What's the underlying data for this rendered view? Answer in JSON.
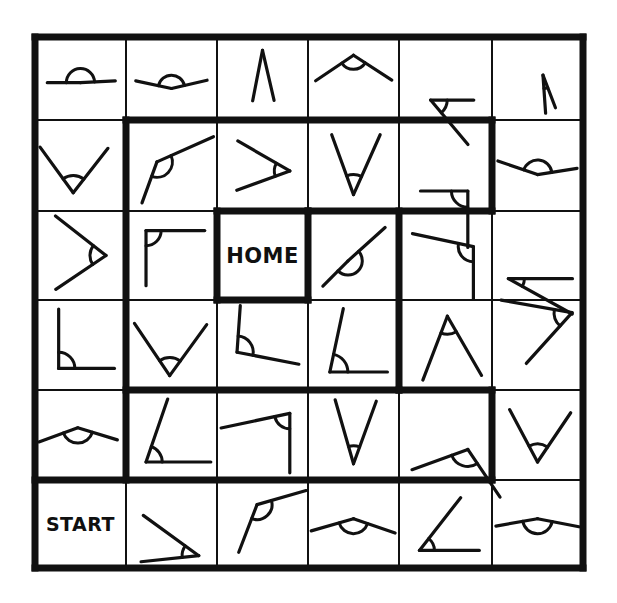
{
  "worksheet": {
    "title": "Angle Maze",
    "grid": {
      "rows": 6,
      "cols": 6
    },
    "geometry": {
      "x_lines": [
        35,
        126,
        217,
        308,
        399,
        492,
        583
      ],
      "y_lines": [
        37,
        120,
        211,
        300,
        390,
        480,
        568
      ],
      "thin_stroke": 2,
      "thick_stroke": 7,
      "ink_color": "#111111",
      "background": "#ffffff"
    },
    "labels": [
      {
        "name": "home-cell-label",
        "text": "HOME",
        "row": 2,
        "col": 2,
        "font_size": 21
      },
      {
        "name": "start-cell-label",
        "text": "START",
        "row": 5,
        "col": 0,
        "font_size": 19
      }
    ],
    "cells": [
      {
        "row": 0,
        "col": 0,
        "kind": "angle",
        "type": "straight-ish",
        "vertex": [
          0.5,
          0.55
        ],
        "ray_a_deg": 180,
        "ray_b_deg": 3,
        "len_a": 0.4,
        "len_b": 0.42,
        "arc_r": 0.17,
        "label": ""
      },
      {
        "row": 0,
        "col": 1,
        "kind": "angle",
        "type": "reflex-wide",
        "vertex": [
          0.5,
          0.62
        ],
        "ray_a_deg": 168,
        "ray_b_deg": 13,
        "len_a": 0.44,
        "len_b": 0.44,
        "arc_r": 0.16,
        "label": ""
      },
      {
        "row": 0,
        "col": 2,
        "kind": "angle",
        "type": "acute-narrow",
        "vertex": [
          0.5,
          0.16
        ],
        "ray_a_deg": 259,
        "ray_b_deg": 283,
        "len_a": 0.62,
        "len_b": 0.62,
        "arc_r": 0.0,
        "label": ""
      },
      {
        "row": 0,
        "col": 3,
        "kind": "angle",
        "type": "obtuse-peak",
        "vertex": [
          0.5,
          0.22
        ],
        "ray_a_deg": 214,
        "ray_b_deg": 327,
        "len_a": 0.55,
        "len_b": 0.55,
        "arc_r": 0.17,
        "label": ""
      },
      {
        "row": 0,
        "col": 4,
        "kind": "angle",
        "type": "obtuse-open-right",
        "vertex": [
          0.34,
          0.76
        ],
        "ray_a_deg": 0,
        "ray_b_deg": 310,
        "len_a": 0.52,
        "len_b": 0.7,
        "arc_r": 0.2,
        "label": ""
      },
      {
        "row": 0,
        "col": 5,
        "kind": "angle",
        "type": "reflex-vertical",
        "vertex": [
          0.56,
          0.46
        ],
        "ray_a_deg": 274,
        "ray_b_deg": 291,
        "len_a": 0.46,
        "len_b": 0.42,
        "arc_r": 0.16,
        "label": ""
      },
      {
        "row": 1,
        "col": 0,
        "kind": "angle",
        "type": "v-acute",
        "vertex": [
          0.42,
          0.8
        ],
        "ray_a_deg": 126,
        "ray_b_deg": 52,
        "len_a": 0.62,
        "len_b": 0.62,
        "arc_r": 0.19,
        "label": ""
      },
      {
        "row": 1,
        "col": 1,
        "kind": "angle",
        "type": "obtuse-diagonal",
        "vertex": [
          0.34,
          0.46
        ],
        "ray_a_deg": 250,
        "ray_b_deg": 24,
        "len_a": 0.48,
        "len_b": 0.68,
        "arc_r": 0.17,
        "label": ""
      },
      {
        "row": 1,
        "col": 2,
        "kind": "angle",
        "type": "acute-point-right",
        "vertex": [
          0.8,
          0.56
        ],
        "ray_a_deg": 150,
        "ray_b_deg": 200,
        "len_a": 0.66,
        "len_b": 0.62,
        "arc_r": 0.17,
        "label": ""
      },
      {
        "row": 1,
        "col": 3,
        "kind": "angle",
        "type": "v-narrow",
        "vertex": [
          0.5,
          0.82
        ],
        "ray_a_deg": 110,
        "ray_b_deg": 66,
        "len_a": 0.7,
        "len_b": 0.72,
        "arc_r": 0.22,
        "label": ""
      },
      {
        "row": 1,
        "col": 4,
        "kind": "angle",
        "type": "right-angle",
        "vertex": [
          0.74,
          0.78
        ],
        "ray_a_deg": 180,
        "ray_b_deg": 270,
        "len_a": 0.52,
        "len_b": 0.62,
        "arc_r": 0.18,
        "label": ""
      },
      {
        "row": 1,
        "col": 5,
        "kind": "angle",
        "type": "reflex-wide",
        "vertex": [
          0.5,
          0.6
        ],
        "ray_a_deg": 161,
        "ray_b_deg": 9,
        "len_a": 0.46,
        "len_b": 0.44,
        "arc_r": 0.16,
        "label": ""
      },
      {
        "row": 2,
        "col": 0,
        "kind": "angle",
        "type": "acute-point-right",
        "vertex": [
          0.78,
          0.5
        ],
        "ray_a_deg": 142,
        "ray_b_deg": 214,
        "len_a": 0.72,
        "len_b": 0.68,
        "arc_r": 0.18,
        "label": ""
      },
      {
        "row": 2,
        "col": 1,
        "kind": "angle",
        "type": "right-angle-corner",
        "vertex": [
          0.22,
          0.22
        ],
        "ray_a_deg": 0,
        "ray_b_deg": 270,
        "len_a": 0.66,
        "len_b": 0.62,
        "arc_r": 0.17,
        "label": ""
      },
      {
        "row": 2,
        "col": 2,
        "kind": "text",
        "type": "home",
        "label": "HOME"
      },
      {
        "row": 2,
        "col": 3,
        "kind": "angle",
        "type": "reflex-diagonal",
        "vertex": [
          0.44,
          0.56
        ],
        "ray_a_deg": 225,
        "ray_b_deg": 42,
        "len_a": 0.4,
        "len_b": 0.56,
        "arc_r": 0.16,
        "label": ""
      },
      {
        "row": 2,
        "col": 4,
        "kind": "angle",
        "type": "obtuse-right-drop",
        "vertex": [
          0.8,
          0.4
        ],
        "ray_a_deg": 168,
        "ray_b_deg": 270,
        "len_a": 0.7,
        "len_b": 0.58,
        "arc_r": 0.17,
        "label": ""
      },
      {
        "row": 2,
        "col": 5,
        "kind": "angle",
        "type": "acute-point-left",
        "vertex": [
          0.18,
          0.76
        ],
        "ray_a_deg": 0,
        "ray_b_deg": 331,
        "len_a": 0.72,
        "len_b": 0.82,
        "arc_r": 0.18,
        "label": ""
      },
      {
        "row": 3,
        "col": 0,
        "kind": "angle",
        "type": "right-angle-corner",
        "vertex": [
          0.26,
          0.76
        ],
        "ray_a_deg": 0,
        "ray_b_deg": 90,
        "len_a": 0.62,
        "len_b": 0.66,
        "arc_r": 0.18,
        "label": ""
      },
      {
        "row": 3,
        "col": 1,
        "kind": "angle",
        "type": "v-acute",
        "vertex": [
          0.48,
          0.84
        ],
        "ray_a_deg": 124,
        "ray_b_deg": 54,
        "len_a": 0.7,
        "len_b": 0.7,
        "arc_r": 0.2,
        "label": ""
      },
      {
        "row": 3,
        "col": 2,
        "kind": "angle",
        "type": "obtuse-drop",
        "vertex": [
          0.22,
          0.58
        ],
        "ray_a_deg": 349,
        "ray_b_deg": 86,
        "len_a": 0.7,
        "len_b": 0.52,
        "arc_r": 0.18,
        "label": ""
      },
      {
        "row": 3,
        "col": 3,
        "kind": "angle",
        "type": "right-angle-corner",
        "vertex": [
          0.24,
          0.8
        ],
        "ray_a_deg": 0,
        "ray_b_deg": 78,
        "len_a": 0.64,
        "len_b": 0.72,
        "arc_r": 0.2,
        "label": ""
      },
      {
        "row": 3,
        "col": 4,
        "kind": "angle",
        "type": "acute-peak",
        "vertex": [
          0.52,
          0.18
        ],
        "ray_a_deg": 249,
        "ray_b_deg": 300,
        "len_a": 0.76,
        "len_b": 0.76,
        "arc_r": 0.2,
        "label": ""
      },
      {
        "row": 3,
        "col": 5,
        "kind": "angle",
        "type": "acute-point-right",
        "vertex": [
          0.88,
          0.14
        ],
        "ray_a_deg": 170,
        "ray_b_deg": 228,
        "len_a": 0.8,
        "len_b": 0.76,
        "arc_r": 0.2,
        "label": ""
      },
      {
        "row": 4,
        "col": 0,
        "kind": "angle",
        "type": "reflex-peak",
        "vertex": [
          0.47,
          0.42
        ],
        "ray_a_deg": 200,
        "ray_b_deg": 343,
        "len_a": 0.46,
        "len_b": 0.46,
        "arc_r": 0.17,
        "label": ""
      },
      {
        "row": 4,
        "col": 1,
        "kind": "angle",
        "type": "acute-corner",
        "vertex": [
          0.22,
          0.8
        ],
        "ray_a_deg": 0,
        "ray_b_deg": 71,
        "len_a": 0.72,
        "len_b": 0.74,
        "arc_r": 0.18,
        "label": ""
      },
      {
        "row": 4,
        "col": 2,
        "kind": "angle",
        "type": "acute-upper-right",
        "vertex": [
          0.8,
          0.26
        ],
        "ray_a_deg": 192,
        "ray_b_deg": 270,
        "len_a": 0.78,
        "len_b": 0.66,
        "arc_r": 0.17,
        "label": ""
      },
      {
        "row": 4,
        "col": 3,
        "kind": "angle",
        "type": "v-narrow",
        "vertex": [
          0.5,
          0.82
        ],
        "ray_a_deg": 106,
        "ray_b_deg": 70,
        "len_a": 0.74,
        "len_b": 0.74,
        "arc_r": 0.2,
        "label": ""
      },
      {
        "row": 4,
        "col": 4,
        "kind": "angle",
        "type": "obtuse-diagonal",
        "vertex": [
          0.74,
          0.66
        ],
        "ray_a_deg": 200,
        "ray_b_deg": 304,
        "len_a": 0.66,
        "len_b": 0.64,
        "arc_r": 0.19,
        "label": ""
      },
      {
        "row": 4,
        "col": 5,
        "kind": "angle",
        "type": "v-wide",
        "vertex": [
          0.5,
          0.8
        ],
        "ray_a_deg": 118,
        "ray_b_deg": 56,
        "len_a": 0.66,
        "len_b": 0.66,
        "arc_r": 0.2,
        "label": ""
      },
      {
        "row": 5,
        "col": 0,
        "kind": "text",
        "type": "start",
        "label": "START"
      },
      {
        "row": 5,
        "col": 1,
        "kind": "angle",
        "type": "acute-point-down",
        "vertex": [
          0.8,
          0.86
        ],
        "ray_a_deg": 144,
        "ray_b_deg": 186,
        "len_a": 0.78,
        "len_b": 0.66,
        "arc_r": 0.19,
        "label": ""
      },
      {
        "row": 5,
        "col": 2,
        "kind": "angle",
        "type": "obtuse-peak",
        "vertex": [
          0.44,
          0.28
        ],
        "ray_a_deg": 249,
        "ray_b_deg": 16,
        "len_a": 0.58,
        "len_b": 0.58,
        "arc_r": 0.17,
        "label": ""
      },
      {
        "row": 5,
        "col": 3,
        "kind": "angle",
        "type": "reflex-peak",
        "vertex": [
          0.5,
          0.44
        ],
        "ray_a_deg": 196,
        "ray_b_deg": 341,
        "len_a": 0.5,
        "len_b": 0.5,
        "arc_r": 0.17,
        "label": ""
      },
      {
        "row": 5,
        "col": 4,
        "kind": "angle",
        "type": "acute-corner",
        "vertex": [
          0.22,
          0.8
        ],
        "ray_a_deg": 0,
        "ray_b_deg": 52,
        "len_a": 0.68,
        "len_b": 0.76,
        "arc_r": 0.17,
        "label": ""
      },
      {
        "row": 5,
        "col": 5,
        "kind": "angle",
        "type": "reflex-peak",
        "vertex": [
          0.5,
          0.44
        ],
        "ray_a_deg": 190,
        "ray_b_deg": 349,
        "len_a": 0.48,
        "len_b": 0.48,
        "arc_r": 0.17,
        "label": ""
      }
    ],
    "path_segments": [
      {
        "name": "outer-border-top",
        "orient": "h",
        "col": 0,
        "col_end": 6,
        "y_line": 0
      },
      {
        "name": "outer-border-bottom",
        "orient": "h",
        "col": 0,
        "col_end": 6,
        "y_line": 6
      },
      {
        "name": "outer-border-left",
        "orient": "v",
        "row": 0,
        "row_end": 6,
        "x_line": 0
      },
      {
        "name": "outer-border-right",
        "orient": "v",
        "row": 0,
        "row_end": 6,
        "x_line": 6
      },
      {
        "name": "path-top-row2",
        "orient": "h",
        "col": 1,
        "col_end": 5,
        "y_line": 1
      },
      {
        "name": "path-left-col2",
        "orient": "v",
        "row": 1,
        "row_end": 5,
        "x_line": 1
      },
      {
        "name": "path-right-col6",
        "orient": "v",
        "row": 1,
        "row_end": 2,
        "x_line": 5
      },
      {
        "name": "path-right-col6-lower",
        "orient": "v",
        "row": 4,
        "row_end": 5,
        "x_line": 5
      },
      {
        "name": "path-bottom-row5",
        "orient": "h",
        "col": 0,
        "col_end": 5,
        "y_line": 5
      },
      {
        "name": "home-top",
        "orient": "h",
        "col": 2,
        "col_end": 3,
        "y_line": 2
      },
      {
        "name": "home-bottom",
        "orient": "h",
        "col": 2,
        "col_end": 3,
        "y_line": 3
      },
      {
        "name": "home-left",
        "orient": "v",
        "row": 2,
        "row_end": 3,
        "x_line": 2
      },
      {
        "name": "home-right",
        "orient": "v",
        "row": 2,
        "row_end": 3,
        "x_line": 3
      },
      {
        "name": "path-inner-right-upper",
        "orient": "v",
        "row": 2,
        "row_end": 4,
        "x_line": 4
      },
      {
        "name": "path-row3-top-right",
        "orient": "h",
        "col": 3,
        "col_end": 5,
        "y_line": 2
      },
      {
        "name": "path-row4-bottom-mid",
        "orient": "h",
        "col": 1,
        "col_end": 4,
        "y_line": 4
      },
      {
        "name": "path-row5-right-seg",
        "orient": "h",
        "col": 4,
        "col_end": 5,
        "y_line": 4
      }
    ]
  }
}
